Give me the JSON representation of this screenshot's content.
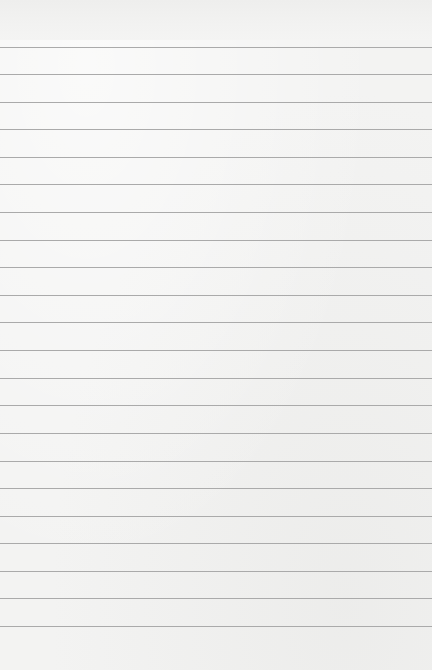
{
  "document": {
    "type": "lined-paper",
    "width": 432,
    "height": 670,
    "background_color": "#f3f3f2",
    "rule_color": "#aaaaaa",
    "rule_count": 22,
    "rule_spacing_px": 27.6,
    "rule_positions_y": [
      47,
      74,
      102,
      129,
      157,
      184,
      212,
      240,
      267,
      295,
      322,
      350,
      378,
      405,
      433,
      461,
      488,
      516,
      543,
      571,
      598,
      626
    ],
    "header_text": ""
  }
}
